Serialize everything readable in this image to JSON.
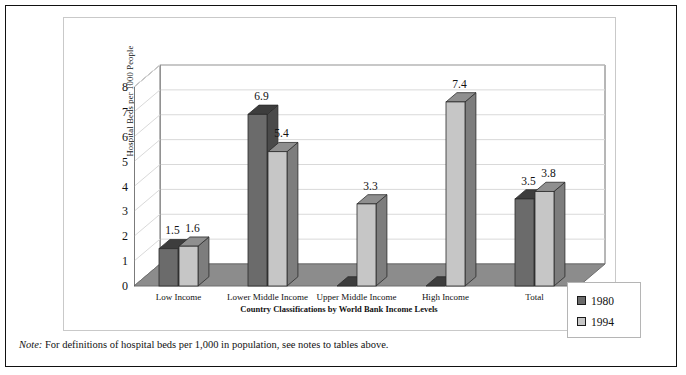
{
  "note": {
    "prefix": "Note:",
    "text": "For definitions of hospital beds per 1,000 in population, see notes to tables above."
  },
  "legend": {
    "entries": [
      {
        "label": "1980",
        "color": "#6b6b6b"
      },
      {
        "label": "1994",
        "color": "#c6c6c6"
      }
    ]
  },
  "colors": {
    "series_1980_front": "#6b6b6b",
    "series_1980_top": "#3d3d3d",
    "series_1980_side": "#4a4a4a",
    "series_1994_front": "#c6c6c6",
    "series_1994_top": "#8f8f8f",
    "series_1994_side": "#7d7d7d",
    "floor": "#8c8c8c",
    "wall": "#ffffff",
    "gridline": "#d9d9d9",
    "frame": "#6e6e6e",
    "outer_border": "#111111"
  },
  "chart_data": {
    "type": "bar",
    "title": "",
    "xlabel": "Country Classifications by World Bank Income Levels",
    "ylabel": "Hospital Beds per 1000 People",
    "categories": [
      "Low Income",
      "Lower Middle Income",
      "Upper Middle Income",
      "High Income",
      "Total"
    ],
    "series": [
      {
        "name": "1980",
        "values": [
          1.5,
          6.9,
          0,
          0,
          3.5
        ]
      },
      {
        "name": "1994",
        "values": [
          1.6,
          5.4,
          3.3,
          7.4,
          3.8
        ]
      }
    ],
    "data_labels": [
      {
        "category": "Low Income",
        "series": "1980",
        "value": 1.5,
        "text": "1.5"
      },
      {
        "category": "Low Income",
        "series": "1994",
        "value": 1.6,
        "text": "1.6"
      },
      {
        "category": "Lower Middle Income",
        "series": "1980",
        "value": 6.9,
        "text": "6.9"
      },
      {
        "category": "Lower Middle Income",
        "series": "1994",
        "value": 5.4,
        "text": "5.4"
      },
      {
        "category": "Upper Middle Income",
        "series": "1994",
        "value": 3.3,
        "text": "3.3"
      },
      {
        "category": "High Income",
        "series": "1994",
        "value": 7.4,
        "text": "7.4"
      },
      {
        "category": "Total",
        "series": "1980",
        "value": 3.5,
        "text": "3.5"
      },
      {
        "category": "Total",
        "series": "1994",
        "value": 3.8,
        "text": "3.8"
      }
    ],
    "yticks": [
      0,
      1,
      2,
      3,
      4,
      5,
      6,
      7,
      8
    ],
    "ylim": [
      0,
      8
    ],
    "grid": true,
    "legend_position": "right-bottom",
    "projection": "3d"
  }
}
